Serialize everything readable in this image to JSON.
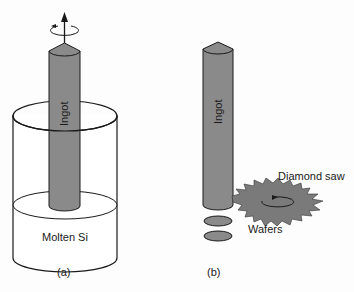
{
  "figure": {
    "panel_a": {
      "caption": "(a)",
      "ingot_label": "Ingot",
      "melt_label": "Molten Si"
    },
    "panel_b": {
      "caption": "(b)",
      "ingot_label": "Ingot",
      "saw_label": "Diamond saw",
      "wafers_label": "Wafers"
    }
  },
  "colors": {
    "ingot_fill": "#8a8a8a",
    "saw_fill": "#7a7a7a",
    "outline": "#1a1a1a"
  }
}
